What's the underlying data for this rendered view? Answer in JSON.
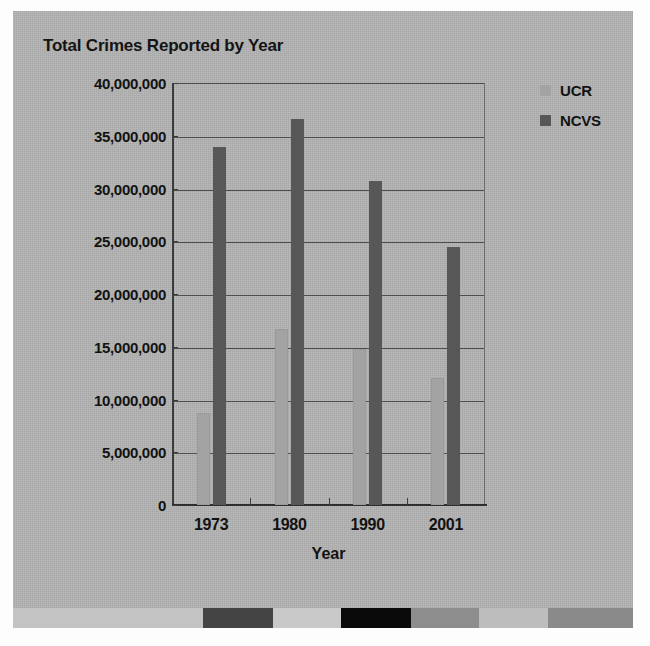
{
  "chart_data": {
    "type": "bar",
    "title": "Total Crimes Reported by Year",
    "xlabel": "Year",
    "ylabel": "",
    "categories": [
      "1973",
      "1980",
      "1990",
      "2001"
    ],
    "series": [
      {
        "name": "UCR",
        "color": "#a3a3a3",
        "values": [
          8700000,
          16700000,
          14800000,
          12000000
        ]
      },
      {
        "name": "NCVS",
        "color": "#575757",
        "values": [
          33900000,
          36600000,
          30700000,
          24500000
        ]
      }
    ],
    "ylim": [
      0,
      40000000
    ],
    "ytick_values": [
      40000000,
      35000000,
      30000000,
      25000000,
      20000000,
      15000000,
      10000000,
      5000000,
      0
    ],
    "ytick_labels": [
      "40,000,000",
      "35,000,000",
      "30,000,000",
      "25,000,000",
      "20,000,000",
      "15,000,000",
      "10,000,000",
      "5,000,000",
      "0"
    ],
    "grid": true,
    "legend_position": "right-top"
  },
  "legend": {
    "items": [
      {
        "label": "UCR",
        "color": "#a3a3a3"
      },
      {
        "label": "NCVS",
        "color": "#575757"
      }
    ]
  },
  "calibration_strip": {
    "segments": [
      {
        "color": "#c3c3c3",
        "width": 245
      },
      {
        "color": "#444444",
        "width": 90
      },
      {
        "color": "#c9c9c9",
        "width": 88
      },
      {
        "color": "#0a0a0a",
        "width": 90
      },
      {
        "color": "#8d8d8d",
        "width": 88
      },
      {
        "color": "#bdbdbd",
        "width": 89
      },
      {
        "color": "#8a8a8a",
        "width": 110
      }
    ]
  },
  "page": {
    "background_color": "#b3b3b3",
    "text_color": "#121212"
  }
}
